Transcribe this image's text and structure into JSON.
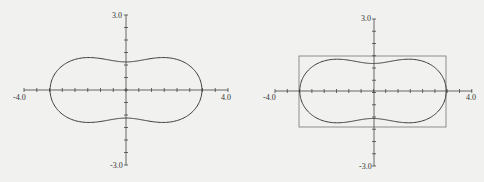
{
  "chart_data": [
    {
      "type": "line",
      "title": "",
      "description": "Closed peanut-shaped curve (Cassini-oval-like), symmetric about both axes",
      "xlabel": "",
      "ylabel": "",
      "xlim": [
        -4.0,
        4.0
      ],
      "ylim": [
        -3.0,
        3.0
      ],
      "x_tick_labels": [
        "-4.0",
        "4.0"
      ],
      "y_tick_labels": [
        "3.0",
        "-3.0"
      ],
      "tick_step": 0.5,
      "grid": false,
      "curve_points": [
        {
          "x": 3.0,
          "y": 0.0
        },
        {
          "x": 2.6,
          "y": 0.9
        },
        {
          "x": 1.5,
          "y": 1.4
        },
        {
          "x": 0.6,
          "y": 1.2
        },
        {
          "x": 0.0,
          "y": 0.95
        },
        {
          "x": -0.6,
          "y": 1.2
        },
        {
          "x": -1.5,
          "y": 1.4
        },
        {
          "x": -2.6,
          "y": 0.9
        },
        {
          "x": -3.0,
          "y": 0.0
        },
        {
          "x": -2.6,
          "y": -0.9
        },
        {
          "x": -1.5,
          "y": -1.4
        },
        {
          "x": -0.6,
          "y": -1.2
        },
        {
          "x": 0.0,
          "y": -0.95
        },
        {
          "x": 0.6,
          "y": -1.2
        },
        {
          "x": 1.5,
          "y": -1.4
        },
        {
          "x": 2.6,
          "y": -0.9
        },
        {
          "x": 3.0,
          "y": 0.0
        }
      ],
      "bounding_box": null
    },
    {
      "type": "line",
      "title": "",
      "description": "Same peanut-shaped curve with its bounding rectangle drawn",
      "xlabel": "",
      "ylabel": "",
      "xlim": [
        -4.0,
        4.0
      ],
      "ylim": [
        -3.0,
        3.0
      ],
      "x_tick_labels": [
        "-4.0",
        "4.0"
      ],
      "y_tick_labels": [
        "3.0",
        "-3.0"
      ],
      "tick_step": 0.5,
      "grid": false,
      "bounding_box": {
        "xmin": -3.0,
        "xmax": 3.0,
        "ymin": -1.45,
        "ymax": 1.45
      }
    }
  ],
  "left": {
    "x_min_label": "-4.0",
    "x_max_label": "4.0",
    "y_max_label": "3.0",
    "y_min_label": "-3.0"
  },
  "right": {
    "x_min_label": "-4.0",
    "x_max_label": "4.0",
    "y_max_label": "3.0",
    "y_min_label": "-3.0"
  }
}
